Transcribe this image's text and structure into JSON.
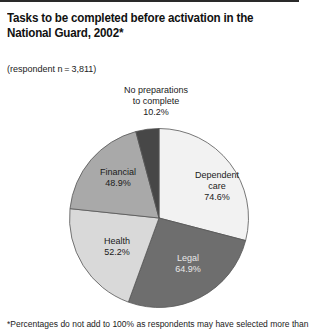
{
  "header": {
    "title": "Tasks to be completed before activation in the National Guard, 2002*",
    "subtitle": "(respondent n = 3,811)"
  },
  "footnote": "*Percentages do not add to 100% as respondents may have selected more than",
  "chart_data": {
    "type": "pie",
    "title": "Tasks to be completed before activation in the National Guard, 2002*",
    "subtitle": "(respondent n=3,811)",
    "categories": [
      "Dependent care",
      "Legal",
      "Health",
      "Financial",
      "No preparations to complete"
    ],
    "values": [
      74.6,
      64.9,
      52.2,
      48.9,
      10.2
    ],
    "unit": "%",
    "colors": [
      "#f2f2f2",
      "#6e6e6e",
      "#d9d9d9",
      "#a9a9a9",
      "#474747"
    ],
    "slice_angles_deg": [
      [
        0,
        104.6
      ],
      [
        104.6,
        200
      ],
      [
        200,
        276
      ],
      [
        276,
        345
      ],
      [
        345,
        360
      ]
    ],
    "labels": [
      {
        "lines": [
          "Dependent",
          "care",
          "74.6%"
        ],
        "color": "#222222"
      },
      {
        "lines": [
          "Legal",
          "64.9%"
        ],
        "color": "#e8e8e8"
      },
      {
        "lines": [
          "Health",
          "52.2%"
        ],
        "color": "#222222"
      },
      {
        "lines": [
          "Financial",
          "48.9%"
        ],
        "color": "#222222"
      },
      {
        "lines": [
          "No preparations",
          "to complete",
          "10.2%"
        ],
        "color": "#222222"
      }
    ],
    "footnote": "*Percentages do not add to 100% as respondents may have selected more than",
    "legend": "none (direct labels)"
  }
}
